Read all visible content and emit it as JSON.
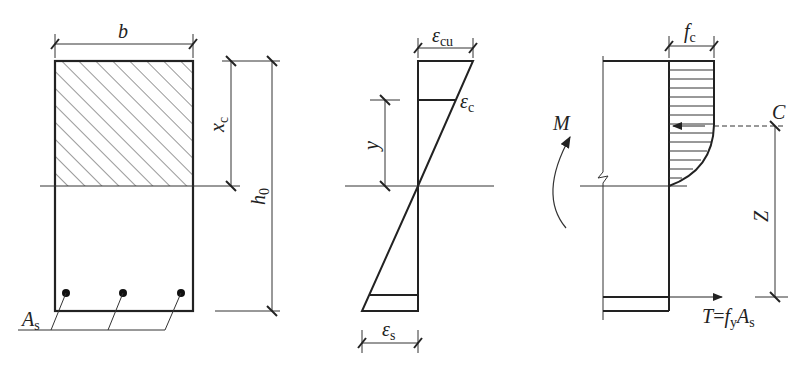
{
  "diagram": {
    "section": {
      "width_label": "b",
      "compression_depth_label": "x",
      "compression_depth_sub": "c",
      "effective_depth_label": "h",
      "effective_depth_sub": "0",
      "steel_area_label": "A",
      "steel_area_sub": "s",
      "bar_count": 3
    },
    "strain": {
      "ultimate_strain_label": "ε",
      "ultimate_strain_sub": "cu",
      "concrete_strain_label": "ε",
      "concrete_strain_sub": "c",
      "depth_label": "y",
      "steel_strain_label": "ε",
      "steel_strain_sub": "s"
    },
    "stress": {
      "concrete_stress_label": "f",
      "concrete_stress_sub": "c",
      "moment_label": "M",
      "compression_label": "C",
      "lever_arm_label": "Z",
      "tension_T": "T",
      "tension_eq": "=",
      "tension_f": "f",
      "tension_f_sub": "y",
      "tension_A": "A",
      "tension_A_sub": "s"
    }
  }
}
